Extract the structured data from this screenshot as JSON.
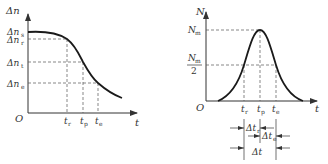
{
  "left_chart": {
    "y_axis_label": "Δn",
    "x_axis_label": "t",
    "origin_label": "O",
    "y_ticks": [
      {
        "base": "Δn",
        "sub": "s"
      },
      {
        "base": "Δn",
        "sub": "r"
      },
      {
        "base": "Δn",
        "sub": "t"
      },
      {
        "base": "Δn",
        "sub": "e"
      }
    ],
    "x_ticks": [
      {
        "base": "t",
        "sub": "r"
      },
      {
        "base": "t",
        "sub": "p"
      },
      {
        "base": "t",
        "sub": "e"
      }
    ]
  },
  "right_chart": {
    "y_axis_label": "N",
    "x_axis_label": "t",
    "origin_label": "O",
    "y_ticks": [
      {
        "base": "N",
        "sub": "m"
      },
      {
        "base": "N",
        "sub": "m",
        "denominator": "2"
      }
    ],
    "x_ticks": [
      {
        "base": "t",
        "sub": "r"
      },
      {
        "base": "t",
        "sub": "p"
      },
      {
        "base": "t",
        "sub": "e"
      }
    ],
    "dimensions": [
      {
        "base": "Δt",
        "sub": "r"
      },
      {
        "base": "Δt",
        "sub": "e"
      },
      {
        "base": "Δt",
        "sub": ""
      }
    ]
  }
}
